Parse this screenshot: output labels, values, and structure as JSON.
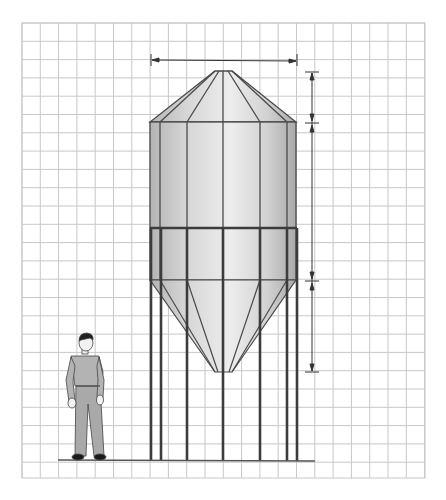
{
  "diagram": {
    "title": "",
    "grid": {
      "x0": 22,
      "y0": 23,
      "x1": 425,
      "y1": 478,
      "cell": 18.3,
      "color": "#c8c8c8"
    },
    "colors": {
      "outline": "#4a4a4a",
      "legs": "#3c3c3c",
      "silo_light": "#e8e8e8",
      "silo_mid": "#cfcfcf",
      "silo_dark": "#a8a8a8",
      "figure_clothes": "#a9a9a9",
      "figure_hair": "#222222",
      "dimension_line": "#333333"
    },
    "dimensions": [
      {
        "id": "diameter",
        "orientation": "horizontal",
        "label": ""
      },
      {
        "id": "roof-height",
        "orientation": "vertical",
        "label": ""
      },
      {
        "id": "cylinder-height",
        "orientation": "vertical",
        "label": ""
      },
      {
        "id": "hopper-height",
        "orientation": "vertical",
        "label": ""
      }
    ],
    "components": [
      "conical roof",
      "cylindrical bin",
      "support ring",
      "hopper cone",
      "support legs",
      "ground line",
      "human scale figure"
    ]
  }
}
